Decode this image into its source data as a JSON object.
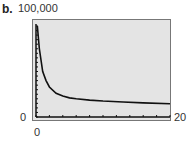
{
  "label": "b.",
  "ymax_label": "100,000",
  "ymin_label": "0",
  "xmin_label": "0",
  "xmax_label": "20",
  "chart_data": {
    "type": "line",
    "title": "",
    "xlabel": "",
    "ylabel": "",
    "xlim": [
      0,
      20
    ],
    "ylim": [
      0,
      100000
    ],
    "x_tick_interval": 2,
    "y_tick_interval": 5000,
    "grid": false,
    "x": [
      0.2,
      0.5,
      1,
      1.5,
      2,
      3,
      4,
      5,
      6,
      8,
      10,
      13,
      16,
      20
    ],
    "values": [
      100000,
      75000,
      50000,
      40000,
      33000,
      26000,
      23000,
      21000,
      20000,
      18500,
      17500,
      16500,
      15500,
      14500
    ]
  }
}
